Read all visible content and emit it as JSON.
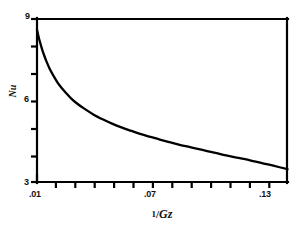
{
  "chart_data": {
    "type": "line",
    "title": "",
    "subtitle": "",
    "xlabel": "1/Gz",
    "ylabel": "Nu",
    "xlabel_parts": {
      "numerator": "1",
      "slash": "/",
      "denominator": "Gz"
    },
    "xlim": [
      0.01,
      0.1425
    ],
    "ylim": [
      3,
      9
    ],
    "grid": false,
    "legend": null,
    "legend_position": "none",
    "x_major_ticks": [
      0.01,
      0.07,
      0.13
    ],
    "x_major_tick_labels": [
      ".01",
      ".07",
      ".13"
    ],
    "x_minor_ticks": [
      0.02,
      0.03,
      0.04,
      0.05,
      0.06,
      0.08,
      0.09,
      0.1,
      0.11,
      0.12,
      0.14
    ],
    "y_major_ticks": [
      3,
      6,
      9
    ],
    "y_major_tick_labels": [
      "3",
      "6",
      "9"
    ],
    "y_minor_ticks": [
      4,
      5,
      7,
      8
    ],
    "series": [
      {
        "name": "Nu",
        "color": "#000000",
        "x": [
          0.01,
          0.011,
          0.012,
          0.013,
          0.014,
          0.015,
          0.0165,
          0.018,
          0.02,
          0.022,
          0.025,
          0.028,
          0.031,
          0.035,
          0.04,
          0.045,
          0.05,
          0.055,
          0.06,
          0.065,
          0.07,
          0.075,
          0.08,
          0.085,
          0.09,
          0.095,
          0.1,
          0.105,
          0.11,
          0.115,
          0.12,
          0.125,
          0.13,
          0.135,
          0.1425
        ],
        "y": [
          8.6,
          8.3,
          8.05,
          7.82,
          7.62,
          7.44,
          7.2,
          7.0,
          6.76,
          6.55,
          6.3,
          6.08,
          5.9,
          5.7,
          5.48,
          5.3,
          5.14,
          5.0,
          4.88,
          4.76,
          4.66,
          4.56,
          4.47,
          4.38,
          4.3,
          4.22,
          4.14,
          4.06,
          3.98,
          3.91,
          3.84,
          3.76,
          3.68,
          3.6,
          3.47
        ]
      }
    ]
  },
  "axes": {
    "y_title": "Nu",
    "x_title": "1/Gz"
  },
  "ticks": {
    "y": {
      "t3": "3",
      "t6": "6",
      "t9": "9"
    },
    "x": {
      "t01": ".01",
      "t07": ".07",
      "t13": ".13"
    }
  }
}
